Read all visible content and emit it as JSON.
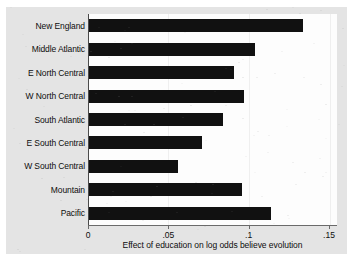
{
  "chart_data": {
    "type": "bar",
    "orientation": "horizontal",
    "title": "",
    "subtitle": "",
    "xlabel": "Effect of education on log odds believe evolution",
    "ylabel": "",
    "categories": [
      "New England",
      "Middle Atlantic",
      "E North Central",
      "W North Central",
      "South Atlantic",
      "E South Central",
      "W South Central",
      "Mountain",
      "Pacific"
    ],
    "values": [
      0.134,
      0.104,
      0.091,
      0.097,
      0.084,
      0.071,
      0.056,
      0.096,
      0.114
    ],
    "xlim": [
      0,
      0.155
    ],
    "ylim": [
      0,
      9
    ],
    "xticks": [
      0,
      0.05,
      0.1,
      0.15
    ],
    "xticklabels": [
      "0",
      ".05",
      ".1",
      ".15"
    ],
    "grid": false,
    "legend": null,
    "bar_color": "#111111",
    "plot_background": "#fdfdfd",
    "figure_background": "#e4e4e4",
    "axis_color": "#4a4a4a"
  }
}
